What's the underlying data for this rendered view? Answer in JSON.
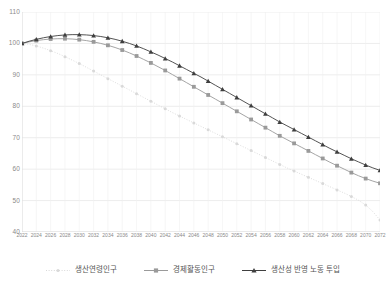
{
  "chart_data": {
    "type": "line",
    "title": "",
    "xlabel": "",
    "ylabel": "",
    "ylim": [
      40,
      110
    ],
    "yticks": [
      40,
      50,
      60,
      70,
      80,
      90,
      100,
      110
    ],
    "grid": true,
    "legend_position": "bottom",
    "x": [
      2022,
      2023,
      2024,
      2025,
      2026,
      2027,
      2028,
      2029,
      2030,
      2031,
      2032,
      2033,
      2034,
      2035,
      2036,
      2037,
      2038,
      2039,
      2040,
      2041,
      2042,
      2043,
      2044,
      2045,
      2046,
      2047,
      2048,
      2049,
      2050,
      2051,
      2052,
      2053,
      2054,
      2055,
      2056,
      2057,
      2058,
      2059,
      2060,
      2061,
      2062,
      2063,
      2064,
      2065,
      2066,
      2067,
      2068,
      2069,
      2070,
      2071,
      2072
    ],
    "xtick_labels": [
      "2022",
      "2024",
      "2026",
      "2028",
      "2030",
      "2032",
      "2034",
      "2036",
      "2038",
      "2040",
      "2042",
      "2044",
      "2046",
      "2048",
      "2050",
      "2052",
      "2054",
      "2056",
      "2058",
      "2060",
      "2062",
      "2064",
      "2066",
      "2068",
      "2070",
      "2072"
    ],
    "series": [
      {
        "name": "생산연령인구",
        "color": "#d9d9d9",
        "marker": "circle",
        "linestyle": "dotted",
        "values": [
          100.0,
          99.7,
          99.2,
          98.5,
          97.7,
          96.8,
          95.8,
          94.7,
          93.6,
          92.4,
          91.2,
          90.0,
          88.8,
          87.6,
          86.4,
          85.2,
          84.0,
          82.8,
          81.6,
          80.4,
          79.2,
          78.0,
          76.9,
          75.8,
          74.7,
          73.6,
          72.5,
          71.4,
          70.3,
          69.2,
          68.1,
          67.0,
          65.9,
          64.8,
          63.7,
          62.6,
          61.5,
          60.4,
          59.4,
          58.4,
          57.4,
          56.4,
          55.4,
          54.4,
          53.4,
          52.4,
          51.3,
          50.1,
          48.6,
          46.5,
          43.8
        ]
      },
      {
        "name": "경제활동인구",
        "color": "#9a9a9a",
        "marker": "square",
        "linestyle": "solid",
        "values": [
          100.0,
          100.5,
          100.9,
          101.2,
          101.4,
          101.5,
          101.5,
          101.4,
          101.2,
          100.9,
          100.5,
          100.0,
          99.4,
          98.7,
          97.9,
          97.0,
          96.0,
          94.9,
          93.8,
          92.6,
          91.4,
          90.1,
          88.8,
          87.5,
          86.2,
          84.9,
          83.6,
          82.3,
          81.0,
          79.7,
          78.4,
          77.1,
          75.8,
          74.5,
          73.2,
          71.9,
          70.6,
          69.4,
          68.2,
          67.0,
          65.8,
          64.6,
          63.4,
          62.2,
          61.1,
          60.0,
          58.9,
          57.9,
          57.0,
          56.2,
          55.5
        ]
      },
      {
        "name": "생산성 반영 노동 투입",
        "color": "#3f3f3f",
        "marker": "triangle",
        "linestyle": "solid",
        "values": [
          100.0,
          100.7,
          101.3,
          101.8,
          102.2,
          102.5,
          102.7,
          102.8,
          102.8,
          102.7,
          102.5,
          102.2,
          101.8,
          101.3,
          100.7,
          100.0,
          99.2,
          98.3,
          97.3,
          96.3,
          95.2,
          94.1,
          92.9,
          91.7,
          90.5,
          89.3,
          88.0,
          86.7,
          85.4,
          84.1,
          82.8,
          81.5,
          80.2,
          78.9,
          77.6,
          76.3,
          75.0,
          73.8,
          72.6,
          71.4,
          70.2,
          69.0,
          67.8,
          66.6,
          65.5,
          64.4,
          63.3,
          62.3,
          61.3,
          60.4,
          59.6
        ]
      }
    ]
  }
}
